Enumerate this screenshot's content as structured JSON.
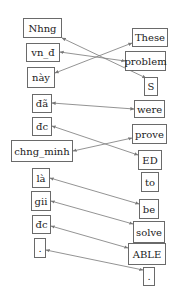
{
  "diagram": {
    "type": "word-alignment",
    "line_color": "#777777",
    "box_border_color": "#6a6a6a",
    "source_tokens": [
      {
        "id": "s0",
        "text": "Nhng",
        "x": 23,
        "y": 18,
        "w": 39,
        "h": 20
      },
      {
        "id": "s1",
        "text": "vn_đ",
        "x": 26,
        "y": 43,
        "w": 34,
        "h": 19
      },
      {
        "id": "s2",
        "text": "này",
        "x": 27,
        "y": 67,
        "w": 28,
        "h": 21
      },
      {
        "id": "s3",
        "text": "đã",
        "x": 32,
        "y": 94,
        "w": 20,
        "h": 19
      },
      {
        "id": "s4",
        "text": "đc",
        "x": 32,
        "y": 117,
        "w": 20,
        "h": 19
      },
      {
        "id": "s5",
        "text": "chng_minh",
        "x": 11,
        "y": 140,
        "w": 62,
        "h": 22
      },
      {
        "id": "s6",
        "text": "là",
        "x": 32,
        "y": 168,
        "w": 18,
        "h": 20
      },
      {
        "id": "s7",
        "text": "gii",
        "x": 31,
        "y": 191,
        "w": 20,
        "h": 20
      },
      {
        "id": "s8",
        "text": "đc",
        "x": 32,
        "y": 215,
        "w": 19,
        "h": 19
      },
      {
        "id": "s9",
        "text": ".",
        "x": 34,
        "y": 238,
        "w": 12,
        "h": 20
      }
    ],
    "target_tokens": [
      {
        "id": "t0",
        "text": "These",
        "x": 132,
        "y": 28,
        "w": 36,
        "h": 19
      },
      {
        "id": "t1",
        "text": "problem",
        "x": 125,
        "y": 51,
        "w": 41,
        "h": 20
      },
      {
        "id": "t2",
        "text": "S",
        "x": 144,
        "y": 77,
        "w": 14,
        "h": 19
      },
      {
        "id": "t3",
        "text": "were",
        "x": 134,
        "y": 100,
        "w": 31,
        "h": 18
      },
      {
        "id": "t4",
        "text": "prove",
        "x": 132,
        "y": 124,
        "w": 35,
        "h": 20
      },
      {
        "id": "t5",
        "text": "ED",
        "x": 138,
        "y": 150,
        "w": 24,
        "h": 20
      },
      {
        "id": "t6",
        "text": "to",
        "x": 141,
        "y": 172,
        "w": 18,
        "h": 20
      },
      {
        "id": "t7",
        "text": "be",
        "x": 139,
        "y": 199,
        "w": 20,
        "h": 20
      },
      {
        "id": "t8",
        "text": "solve",
        "x": 133,
        "y": 221,
        "w": 32,
        "h": 22
      },
      {
        "id": "t9",
        "text": "ABLE",
        "x": 128,
        "y": 243,
        "w": 38,
        "h": 22
      },
      {
        "id": "t10",
        "text": ".",
        "x": 143,
        "y": 267,
        "w": 12,
        "h": 19
      }
    ],
    "alignments": [
      {
        "from": "s0",
        "to": "t2",
        "x1": 62,
        "y1": 38,
        "x2": 146,
        "y2": 78
      },
      {
        "from": "s1",
        "to": "t1",
        "x1": 60,
        "y1": 52,
        "x2": 125,
        "y2": 61
      },
      {
        "from": "s2",
        "to": "t0",
        "x1": 55,
        "y1": 73,
        "x2": 132,
        "y2": 43
      },
      {
        "from": "s3",
        "to": "t3",
        "x1": 52,
        "y1": 103,
        "x2": 134,
        "y2": 109
      },
      {
        "from": "s4",
        "to": "t5",
        "x1": 52,
        "y1": 126,
        "x2": 138,
        "y2": 155
      },
      {
        "from": "s5",
        "to": "t4",
        "x1": 73,
        "y1": 151,
        "x2": 132,
        "y2": 138
      },
      {
        "from": "s6",
        "to": "t7",
        "x1": 50,
        "y1": 178,
        "x2": 139,
        "y2": 204
      },
      {
        "from": "s7",
        "to": "t8",
        "x1": 51,
        "y1": 201,
        "x2": 133,
        "y2": 224
      },
      {
        "from": "s8",
        "to": "t9",
        "x1": 51,
        "y1": 226,
        "x2": 128,
        "y2": 248
      },
      {
        "from": "s9",
        "to": "t10",
        "x1": 46,
        "y1": 250,
        "x2": 143,
        "y2": 270
      }
    ]
  }
}
